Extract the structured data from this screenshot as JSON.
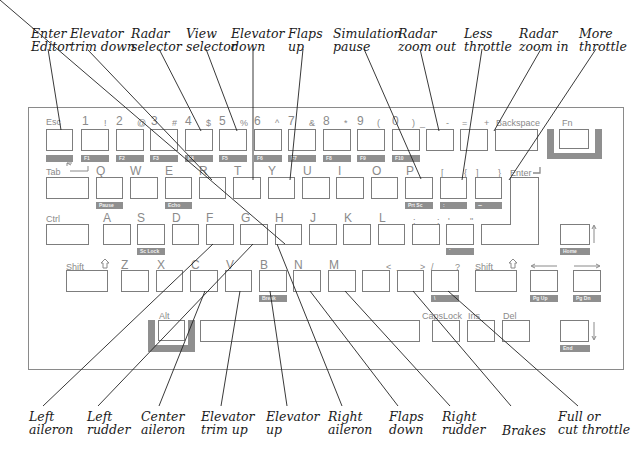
{
  "callouts_top": [
    {
      "id": "enter-editor",
      "line1": "Enter",
      "line2": "Editor"
    },
    {
      "id": "elevator-trim-down",
      "line1": "Elevator",
      "line2": "trim down"
    },
    {
      "id": "radar-selector",
      "line1": "Radar",
      "line2": "selector"
    },
    {
      "id": "view-selector",
      "line1": "View",
      "line2": "selector"
    },
    {
      "id": "elevator-down",
      "line1": "Elevator",
      "line2": "down"
    },
    {
      "id": "flaps-up",
      "line1": "Flaps",
      "line2": "up"
    },
    {
      "id": "simulation-pause",
      "line1": "Simulation",
      "line2": "pause"
    },
    {
      "id": "radar-zoom-out",
      "line1": "Radar",
      "line2": "zoom out"
    },
    {
      "id": "less-throttle",
      "line1": "Less",
      "line2": "throttle"
    },
    {
      "id": "radar-zoom-in",
      "line1": "Radar",
      "line2": "zoom in"
    },
    {
      "id": "more-throttle",
      "line1": "More",
      "line2": "throttle"
    }
  ],
  "callouts_bottom": [
    {
      "id": "left-aileron",
      "line1": "Left",
      "line2": "aileron"
    },
    {
      "id": "left-rudder",
      "line1": "Left",
      "line2": "rudder"
    },
    {
      "id": "center-aileron",
      "line1": "Center",
      "line2": "aileron"
    },
    {
      "id": "elevator-trim-up",
      "line1": "Elevator",
      "line2": "trim up"
    },
    {
      "id": "elevator-up",
      "line1": "Elevator",
      "line2": "up"
    },
    {
      "id": "right-aileron",
      "line1": "Right",
      "line2": "aileron"
    },
    {
      "id": "flaps-down",
      "line1": "Flaps",
      "line2": "down"
    },
    {
      "id": "right-rudder",
      "line1": "Right",
      "line2": "rudder"
    },
    {
      "id": "brakes",
      "line1": "Brakes",
      "line2": ""
    },
    {
      "id": "full-or-cut-throttle",
      "line1": "Full or",
      "line2": "cut throttle"
    }
  ],
  "keyboard": {
    "row1": {
      "esc": "Esc",
      "k1": "1",
      "k1s": "!",
      "k2": "2",
      "k2s": "@",
      "k3": "3",
      "k3s": "#",
      "k4": "4",
      "k4s": "$",
      "k5": "5",
      "k5s": "%",
      "k6": "6",
      "k6s": "^",
      "k7": "7",
      "k7s": "&",
      "k8": "8",
      "k8s": "*",
      "k9": "9",
      "k9s": "(",
      "k0": "0",
      "k0s": ")",
      "minus": "-",
      "minus_s": "_",
      "equals": "=",
      "equals_s": "+",
      "backspace": "Backspace",
      "fn": "Fn",
      "ftags": [
        "",
        "F1",
        "F2",
        "F3",
        "F4",
        "F5",
        "F6",
        "F7",
        "F8",
        "F9",
        "F10"
      ]
    },
    "row2": {
      "tab": "Tab",
      "q": "Q",
      "w": "W",
      "e": "E",
      "r": "R",
      "t": "T",
      "y": "Y",
      "u": "U",
      "i": "I",
      "o": "O",
      "p": "P",
      "lbracket": "[",
      "lbracket_s": "{",
      "rbracket": "]",
      "rbracket_s": "}",
      "enter": "Enter",
      "tag_q": "Pause",
      "tag_e": "Echo",
      "tag_p": "Prt Sc",
      "tag_lbracket": ":",
      "tag_rbracket": "~"
    },
    "row3": {
      "ctrl": "Ctrl",
      "a": "A",
      "s": "S",
      "d": "D",
      "f": "F",
      "g": "G",
      "h": "H",
      "j": "J",
      "k": "K",
      "l": "L",
      "semicolon": ";",
      "semicolon_s": ":",
      "quote": "'",
      "quote_s": "\"",
      "tag_s": "Sc Lock",
      "tag_quote": "`",
      "tag_home": "Home"
    },
    "row4": {
      "lshift": "Shift",
      "z": "Z",
      "x": "X",
      "c": "C",
      "v": "V",
      "b": "B",
      "n": "N",
      "m": "M",
      "comma": ",",
      "comma_s": "<",
      "period": ".",
      "period_s": ">",
      "slash": "/",
      "slash_s": "?",
      "rshift": "Shift",
      "tag_b": "Break",
      "tag_slash": "\\",
      "tag_pgup": "Pg Up",
      "tag_pgdn": "Pg Dn"
    },
    "row5": {
      "alt": "Alt",
      "capslock": "CapsLock",
      "ins": "Ins",
      "del": "Del",
      "tag_end": "End"
    }
  },
  "colors": {
    "outline": "#7d7d7d",
    "tag": "#8f8f8f",
    "text": "#1a1a1a",
    "legend": "#8a8a8a"
  }
}
